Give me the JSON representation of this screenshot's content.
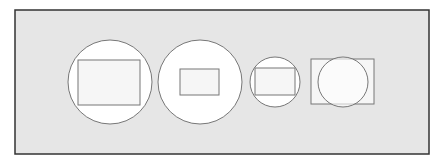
{
  "diagram": {
    "colors": {
      "background": "#ffffff",
      "panel_fill": "#e6e6e6",
      "panel_stroke": "#333333",
      "shape_fill": "#ffffff",
      "inner_fill": "#f6f6f6",
      "shape_stroke": "#777777"
    },
    "panel": {
      "x": 15,
      "y": 10,
      "width": 414,
      "height": 144
    },
    "pairs": [
      {
        "label": "large circle with large inscribed rectangle",
        "circle": {
          "cx": 110,
          "cy": 82,
          "r": 42
        },
        "rect": {
          "x": 78,
          "y": 60,
          "width": 62,
          "height": 45
        },
        "order": "circle-behind"
      },
      {
        "label": "large circle with small rectangle",
        "circle": {
          "cx": 200,
          "cy": 82,
          "r": 42
        },
        "rect": {
          "x": 180,
          "y": 69,
          "width": 39,
          "height": 26
        },
        "order": "circle-behind"
      },
      {
        "label": "small circle with inscribed rectangle",
        "circle": {
          "cx": 275,
          "cy": 82,
          "r": 25
        },
        "rect": {
          "x": 255,
          "y": 68,
          "width": 40,
          "height": 27
        },
        "order": "circle-behind"
      },
      {
        "label": "rectangle with overlapping circle",
        "circle": {
          "cx": 343,
          "cy": 82,
          "r": 25
        },
        "rect": {
          "x": 311,
          "y": 59,
          "width": 63,
          "height": 45
        },
        "order": "rect-behind"
      }
    ]
  }
}
